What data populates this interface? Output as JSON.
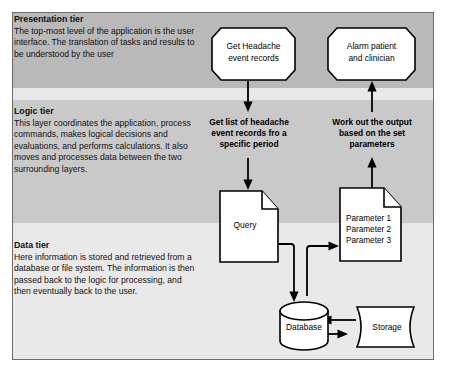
{
  "diagram": {
    "frame": {
      "border_color": "#6d6d6d",
      "background": "#e8e8e8"
    },
    "tiers": [
      {
        "id": "presentation",
        "title": "Presentation tier",
        "body": "The top-most level of the application is the user interface. The translation of tasks and results to be understood by the user",
        "band_color": "#b9b9b9"
      },
      {
        "id": "logic",
        "title": "Logic tier",
        "body": "This layer coordinates the application, process commands, makes logical decisions and evaluations, and performs calculations. It also moves and processes data between the two surrounding layers.",
        "band_color": "#c9c9c9"
      },
      {
        "id": "data",
        "title": "Data tier",
        "body": "Here information is stored and retrieved from a database or file system.  The information is then passed back to the logic for processing, and then eventually back to the user.",
        "band_color": "#e9e9e9"
      }
    ],
    "nodes": {
      "get_headache": {
        "shape": "octagon",
        "lines": [
          "Get Headache",
          "event records"
        ]
      },
      "alarm": {
        "shape": "octagon",
        "lines": [
          "Alarm patient",
          "and clinician"
        ]
      },
      "get_list_step": {
        "shape": "text",
        "lines": [
          "Get list of headache",
          "event records fro a",
          "specific period"
        ]
      },
      "work_out_step": {
        "shape": "text",
        "lines": [
          "Work out the output",
          "based on the set",
          "parameters"
        ]
      },
      "query_doc": {
        "shape": "document",
        "lines": [
          "Query"
        ]
      },
      "parameter_doc": {
        "shape": "document",
        "lines": [
          "Parameter 1",
          "Parameter 2",
          "Parameter 3"
        ]
      },
      "database": {
        "shape": "cylinder",
        "lines": [
          "Database"
        ]
      },
      "storage": {
        "shape": "stored-data",
        "lines": [
          "Storage"
        ]
      }
    },
    "colors": {
      "shape_fill": "#ffffff",
      "shape_stroke": "#000000",
      "connector": "#000000",
      "text": "#111111"
    }
  }
}
